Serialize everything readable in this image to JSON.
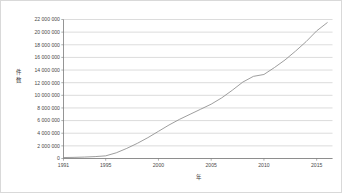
{
  "chart_data": {
    "type": "line",
    "title": "",
    "xlabel": "年",
    "ylabel": "件数",
    "xlim": [
      1991,
      2016.5
    ],
    "ylim": [
      0,
      22000000
    ],
    "grid": true,
    "legend": false,
    "x_tick_labels": [
      "1991",
      "1995",
      "2000",
      "2005",
      "2010",
      "2015"
    ],
    "x_tick_values": [
      1991,
      1995,
      2000,
      2005,
      2010,
      2015
    ],
    "y_tick_labels": [
      "0",
      "2 000 000",
      "4 000 000",
      "6 000 000",
      "8 000 000",
      "10 000 000",
      "12 000 000",
      "14 000 000",
      "16 000 000",
      "18 000 000",
      "20 000 000",
      "22 000 000"
    ],
    "y_tick_values": [
      0,
      2000000,
      4000000,
      6000000,
      8000000,
      10000000,
      12000000,
      14000000,
      16000000,
      18000000,
      20000000,
      22000000
    ],
    "series": [
      {
        "name": "累積件数",
        "color": "#8c8c8c",
        "x": [
          1991,
          1992,
          1993,
          1994,
          1995,
          1996,
          1997,
          1998,
          1999,
          2000,
          2001,
          2002,
          2003,
          2004,
          2005,
          2006,
          2007,
          2008,
          2009,
          2010,
          2011,
          2012,
          2013,
          2014,
          2015,
          2016
        ],
        "values": [
          150000,
          180000,
          230000,
          300000,
          420000,
          900000,
          1600000,
          2400000,
          3300000,
          4300000,
          5300000,
          6200000,
          7000000,
          7800000,
          8600000,
          9600000,
          10800000,
          12100000,
          13000000,
          13300000,
          14400000,
          15600000,
          17000000,
          18500000,
          20200000,
          21500000
        ]
      }
    ]
  },
  "axis_titles": {
    "y_char_1": "件",
    "y_char_2": "数",
    "x": "年"
  }
}
